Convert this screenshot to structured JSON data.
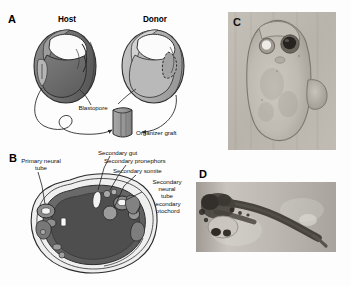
{
  "figure": {
    "background_color": "#fdfdfd",
    "width": 351,
    "height": 286
  },
  "panels": [
    {
      "letter": "A",
      "type": "schematic",
      "description": "Organizer graft transplantation diagram"
    },
    {
      "letter": "B",
      "type": "schematic",
      "description": "Transverse section of embryo with secondary axis"
    },
    {
      "letter": "C",
      "type": "photograph",
      "description": "Dorsal view of embryo with secondary axis"
    },
    {
      "letter": "D",
      "type": "photograph",
      "description": "Lateral view of tadpole with secondary axis"
    }
  ],
  "panel_a": {
    "letter": "A",
    "host_label": "Host",
    "donor_label": "Donor",
    "blastopore_label": "Blastopore",
    "organizer_graft_label": "Organizer graft",
    "host_color": "#6f6f6f",
    "donor_color": "#b3b3b3",
    "graft_color": "#9a9a9a"
  },
  "panel_b": {
    "letter": "B",
    "labels": [
      {
        "id": "primary-neural-tube",
        "text_lines": [
          "Primary neural",
          "tube"
        ]
      },
      {
        "id": "secondary-gut",
        "text_lines": [
          "Secondary gut"
        ]
      },
      {
        "id": "secondary-pronephros",
        "text_lines": [
          "Secondary pronephors"
        ]
      },
      {
        "id": "secondary-somite",
        "text_lines": [
          "Secondary somite"
        ]
      },
      {
        "id": "secondary-neural-tube",
        "text_lines": [
          "Secondary",
          "neural",
          "tube"
        ]
      },
      {
        "id": "secondary-notochord",
        "text_lines": [
          "Secondary",
          "notochord"
        ]
      }
    ],
    "section_color": "#5f5f5f",
    "yolk_color": "#4a4a4a"
  },
  "panel_c": {
    "letter": "C",
    "photo_tone": "#b9b5ad"
  },
  "panel_d": {
    "letter": "D",
    "photo_tone": "#b5b2ab"
  },
  "icons": {
    "arrow": "arrow-icon",
    "leader_line": "leader-line-icon"
  }
}
